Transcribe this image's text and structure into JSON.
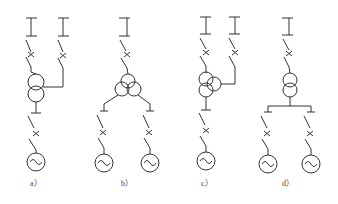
{
  "diagram": {
    "type": "electrical single-line diagrams",
    "panels": [
      {
        "id": "a",
        "label": "a）",
        "description": "two-winding transformer with one HV bus feeder and side connection, one generator"
      },
      {
        "id": "b",
        "label": "b）",
        "description": "three-winding transformer with one HV bus feeder, two generators"
      },
      {
        "id": "c",
        "label": "c）",
        "description": "three-winding transformer with two HV bus feeders, one generator"
      },
      {
        "id": "d",
        "label": "d）",
        "description": "two-winding transformer with one HV bus feeder and split LV bus, two generators"
      }
    ],
    "symbols": [
      "bus-bar",
      "disconnector-switch",
      "circuit-breaker",
      "transformer",
      "generator"
    ]
  }
}
